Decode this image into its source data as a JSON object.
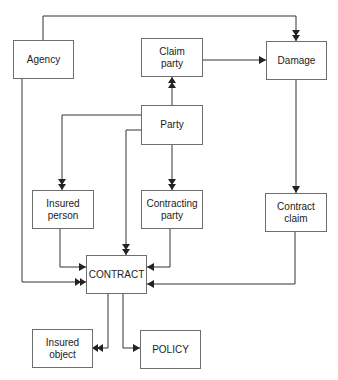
{
  "diagram": {
    "type": "entity-relationship",
    "line_color": "#333333",
    "box_border_color": "#6e6e6e",
    "entities": {
      "agency": {
        "label": "Agency"
      },
      "claim_party": {
        "label": "Claim\nparty"
      },
      "damage": {
        "label": "Damage"
      },
      "party": {
        "label": "Party"
      },
      "insured_person": {
        "label": "Insured\nperson"
      },
      "contracting_party": {
        "label": "Contracting\nparty"
      },
      "contract_claim": {
        "label": "Contract\nclaim"
      },
      "contract": {
        "label": "CONTRACT"
      },
      "insured_object": {
        "label": "Insured\nobject"
      },
      "policy": {
        "label": "POLICY"
      }
    },
    "relationships": [
      {
        "from": "agency",
        "to": "damage",
        "from_end": "single",
        "to_end": "double"
      },
      {
        "from": "claim_party",
        "to": "damage",
        "from_end": "double",
        "to_end": "single"
      },
      {
        "from": "party",
        "to": "claim_party",
        "from_end": "none",
        "to_end": "double"
      },
      {
        "from": "party",
        "to": "insured_person",
        "from_end": "single",
        "to_end": "double"
      },
      {
        "from": "party",
        "to": "contract",
        "from_end": "single",
        "to_end": "double"
      },
      {
        "from": "party",
        "to": "contracting_party",
        "from_end": "single",
        "to_end": "double"
      },
      {
        "from": "damage",
        "to": "contract_claim",
        "from_end": "single",
        "to_end": "single"
      },
      {
        "from": "insured_person",
        "to": "contract",
        "from_end": "double",
        "to_end": "single"
      },
      {
        "from": "contracting_party",
        "to": "contract",
        "from_end": "double",
        "to_end": "single"
      },
      {
        "from": "agency",
        "to": "contract",
        "from_end": "single",
        "to_end": "double"
      },
      {
        "from": "contract_claim",
        "to": "contract",
        "from_end": "double",
        "to_end": "single"
      },
      {
        "from": "contract",
        "to": "insured_object",
        "from_end": "single",
        "to_end": "double"
      },
      {
        "from": "contract",
        "to": "policy",
        "from_end": "double",
        "to_end": "single"
      }
    ]
  }
}
